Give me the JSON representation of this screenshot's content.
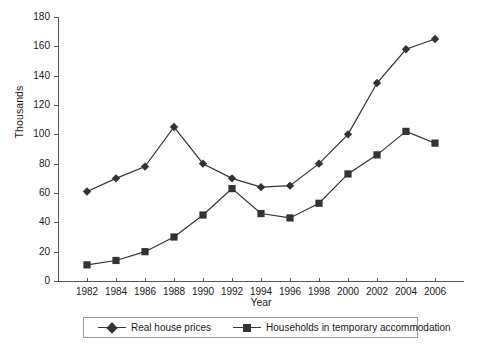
{
  "chart_data": {
    "type": "line",
    "title": "",
    "xlabel": "Year",
    "ylabel": "Thousands",
    "categories": [
      1982,
      1984,
      1986,
      1988,
      1990,
      1992,
      1994,
      1996,
      1998,
      2000,
      2002,
      2004,
      2006
    ],
    "xticklabels": [
      "1982",
      "1984",
      "1986",
      "1988",
      "1990",
      "1992",
      "1994",
      "1996",
      "1998",
      "2000",
      "2002",
      "2004",
      "2006"
    ],
    "yticks": [
      0,
      20,
      40,
      60,
      80,
      100,
      120,
      140,
      160,
      180
    ],
    "yticklabels": [
      "0",
      "20",
      "40",
      "60",
      "80",
      "100",
      "120",
      "140",
      "160",
      "180"
    ],
    "ylim": [
      0,
      180
    ],
    "xlim": [
      1981,
      2007
    ],
    "grid": false,
    "legend_position": "bottom",
    "series": [
      {
        "name": "Real house prices",
        "marker": "diamond",
        "color": "#333333",
        "values": [
          61,
          70,
          78,
          105,
          80,
          70,
          64,
          65,
          80,
          100,
          135,
          158,
          165
        ]
      },
      {
        "name": "Households in temporary accommodation",
        "marker": "square",
        "color": "#333333",
        "values": [
          11,
          14,
          20,
          30,
          45,
          63,
          46,
          43,
          53,
          73,
          86,
          102,
          94
        ]
      }
    ]
  },
  "axis": {
    "y_label": "Thousands",
    "x_label": "Year"
  },
  "legend": {
    "entries": [
      {
        "label": "Real house prices",
        "marker": "diamond-marker-icon"
      },
      {
        "label": "Households in temporary accommodation",
        "marker": "square-marker-icon"
      }
    ]
  }
}
